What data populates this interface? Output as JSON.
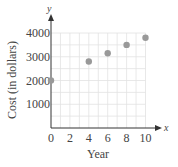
{
  "chart_data": {
    "type": "scatter",
    "title": "",
    "xlabel": "Year",
    "ylabel": "Cost (in dollars)",
    "x_axis_letter": "x",
    "y_axis_letter": "y",
    "xlim": [
      0,
      10
    ],
    "ylim": [
      0,
      4000
    ],
    "x_ticks": [
      0,
      2,
      4,
      6,
      8,
      10
    ],
    "y_ticks": [
      1000,
      2000,
      3000,
      4000
    ],
    "grid": true,
    "grid_x_step": 1,
    "grid_y_step": 500,
    "series": [
      {
        "name": "Cost",
        "color": "#999999",
        "points": [
          {
            "x": 0,
            "y": 2000
          },
          {
            "x": 4,
            "y": 2800
          },
          {
            "x": 6,
            "y": 3150
          },
          {
            "x": 8,
            "y": 3500
          },
          {
            "x": 10,
            "y": 3800
          }
        ]
      }
    ],
    "legend": null
  },
  "colors": {
    "axis": "#333333",
    "grid": "#e2e2e2",
    "point": "#999999",
    "text": "#444444"
  }
}
